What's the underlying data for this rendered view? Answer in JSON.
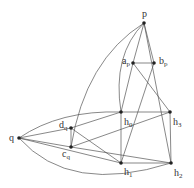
{
  "diagram": {
    "type": "graph",
    "nodes": [
      {
        "id": "p",
        "label": "p",
        "sub": "",
        "x": 144,
        "y": 23,
        "lx": 142,
        "ly": 17
      },
      {
        "id": "ap",
        "label": "a",
        "sub": "p",
        "x": 133,
        "y": 63,
        "lx": 122,
        "ly": 64
      },
      {
        "id": "bp",
        "label": "b",
        "sub": "p",
        "x": 154,
        "y": 63,
        "lx": 159,
        "ly": 64
      },
      {
        "id": "h0",
        "label": "h",
        "sub": "0",
        "x": 121,
        "y": 112,
        "lx": 124,
        "ly": 125
      },
      {
        "id": "h3",
        "label": "h",
        "sub": "3",
        "x": 170,
        "y": 112,
        "lx": 173,
        "ly": 125
      },
      {
        "id": "dq",
        "label": "d",
        "sub": "q",
        "x": 71,
        "y": 128,
        "lx": 59,
        "ly": 128
      },
      {
        "id": "q",
        "label": "q",
        "sub": "",
        "x": 19,
        "y": 138,
        "lx": 9,
        "ly": 141
      },
      {
        "id": "cq",
        "label": "c",
        "sub": "q",
        "x": 71,
        "y": 147,
        "lx": 62,
        "ly": 157
      },
      {
        "id": "h1",
        "label": "h",
        "sub": "1",
        "x": 121,
        "y": 163,
        "lx": 124,
        "ly": 175
      },
      {
        "id": "h2",
        "label": "h",
        "sub": "2",
        "x": 171,
        "y": 163,
        "lx": 174,
        "ly": 176
      }
    ],
    "edges": [
      {
        "from": "p",
        "to": "ap",
        "path": "M144 23 L133 63"
      },
      {
        "from": "p",
        "to": "bp",
        "path": "M144 23 L154 63"
      },
      {
        "from": "ap",
        "to": "bp",
        "path": "M133 63 L154 63"
      },
      {
        "from": "p",
        "to": "h2",
        "path": "M144 23 L171 163"
      },
      {
        "from": "p",
        "to": "h0",
        "path": "M144 23 Q112 55 121 112"
      },
      {
        "from": "p",
        "to": "cq",
        "path": "M144 23 Q85 60 71 147"
      },
      {
        "from": "ap",
        "to": "h0",
        "path": "M133 63 L121 112"
      },
      {
        "from": "ap",
        "to": "h3",
        "path": "M133 63 L170 112"
      },
      {
        "from": "bp",
        "to": "h1",
        "path": "M154 63 L121 163"
      },
      {
        "from": "h0",
        "to": "h3",
        "path": "M121 112 L170 112"
      },
      {
        "from": "h0",
        "to": "h1",
        "path": "M121 112 L121 163"
      },
      {
        "from": "h3",
        "to": "h2",
        "path": "M170 112 L171 163"
      },
      {
        "from": "h1",
        "to": "h2",
        "path": "M121 163 L171 163"
      },
      {
        "from": "q",
        "to": "h0",
        "path": "M19 138 Q60 110 121 112"
      },
      {
        "from": "q",
        "to": "dq",
        "path": "M19 138 L71 128"
      },
      {
        "from": "q",
        "to": "cq",
        "path": "M19 138 L71 147"
      },
      {
        "from": "q",
        "to": "h1",
        "path": "M19 138 L121 163"
      },
      {
        "from": "q",
        "to": "h2",
        "path": "M19 138 Q70 195 171 163"
      },
      {
        "from": "dq",
        "to": "cq",
        "path": "M71 128 L71 147"
      },
      {
        "from": "dq",
        "to": "h0",
        "path": "M71 128 L121 112"
      },
      {
        "from": "dq",
        "to": "h1",
        "path": "M71 128 L121 163"
      },
      {
        "from": "cq",
        "to": "h3",
        "path": "M71 147 L170 112"
      },
      {
        "from": "cq",
        "to": "h2",
        "path": "M71 147 L171 163"
      }
    ]
  }
}
